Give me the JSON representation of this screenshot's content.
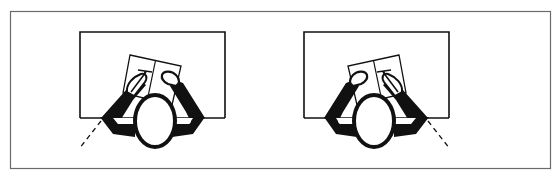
{
  "figure": {
    "colors": {
      "background": "#ffffff",
      "frame": "#6b6b6b",
      "ink": "#111111"
    },
    "panels": [
      {
        "id": "left",
        "writing_hand": "left-side pen hand",
        "light_direction": "from lower-left"
      },
      {
        "id": "right",
        "writing_hand": "right-side pen hand",
        "light_direction": "from lower-right"
      }
    ]
  }
}
